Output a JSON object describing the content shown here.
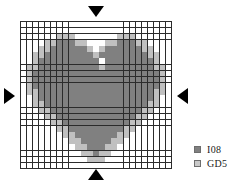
{
  "figure": {
    "title": ""
  },
  "grid": {
    "columns": 25,
    "rows": 24,
    "cell_size_px": 6,
    "line_color": "#2b2b2b",
    "empty_color": "#ffffff",
    "dark_color": "#808080",
    "light_color": "#c0c0c0",
    "legend_key_dark": "I08",
    "legend_key_light": "GD5",
    "cells": [
      "-------------------------",
      "-------------------------",
      "------LLL-------LLL------",
      "----LLDDDLL---LLDDDLL----",
      "---LLDDDDDDL-LDDDDDDLL---",
      "--LLDDDDDDDDLDDDDDDDDLL--",
      "--LDDDDDDDDDD-DDDDDDDDL--",
      "-LLDDDDDDDDDDLDDDDDDDDLL-",
      "-LDDDDDDDDDDDDDDDDDDDDDL-",
      "-LDDDDDDDDDDDDDDDDDDDDDL-",
      "-LDDDDDDDDDDDDDDDDDDDDDL-",
      "-LLDDDDDDDDDDDDDDDDDDDLL-",
      "--LDDDDDDDDDDDDDDDDDDDL--",
      "--LLDDDDDDDDDDDDDDDDDLL--",
      "---LLDDDDDDDDDDDDDDDLL---",
      "----LLDDDDDDDDDDDDDLL----",
      "-----LLDDDDDDDDDDDLL-----",
      "------LLDDDDDDDDDLL------",
      "-------LLDDDDDDDLL-------",
      "--------LLDDDDDLL--------",
      "---------LLDDDLL---------",
      "----------LLDLL----------",
      "-----------LLL-----------",
      "-------------------------"
    ]
  },
  "markers": {
    "top": {
      "name": "top-marker",
      "direction": "down",
      "color": "#000000"
    },
    "bottom": {
      "name": "bottom-marker",
      "direction": "up",
      "color": "#000000"
    },
    "left": {
      "name": "left-marker",
      "direction": "right",
      "color": "#000000"
    },
    "right": {
      "name": "right-marker",
      "direction": "left",
      "color": "#000000"
    }
  },
  "legend": {
    "items": [
      {
        "label": "I08",
        "color": "#808080",
        "swatch": "dark"
      },
      {
        "label": "GD5",
        "color": "#c9c9c9",
        "swatch": "light"
      }
    ]
  }
}
